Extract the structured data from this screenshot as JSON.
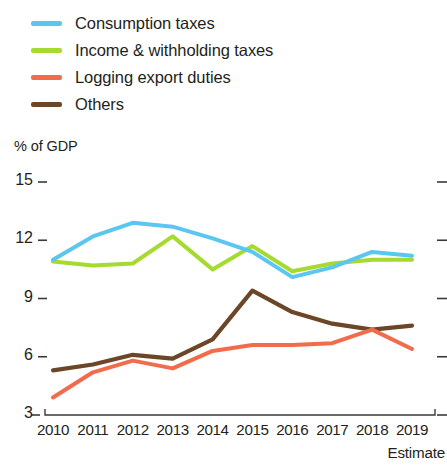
{
  "legend": {
    "items": [
      {
        "label": "Consumption taxes",
        "color": "#5bc6ef",
        "icon": "line-swatch-icon"
      },
      {
        "label": "Income & withholding taxes",
        "color": "#a5da2f",
        "icon": "line-swatch-icon"
      },
      {
        "label": "Logging export duties",
        "color": "#f26b4a",
        "icon": "line-swatch-icon"
      },
      {
        "label": "Others",
        "color": "#6b4627",
        "icon": "line-swatch-icon"
      }
    ]
  },
  "axis": {
    "y_title": "% of GDP",
    "y_ticks": [
      "15",
      "12",
      "9",
      "6",
      "3"
    ],
    "x_ticks": [
      "2010",
      "2011",
      "2012",
      "2013",
      "2014",
      "2015",
      "2016",
      "2017",
      "2018",
      "2019"
    ],
    "note": "Estimate"
  },
  "chart_data": {
    "type": "line",
    "title": "",
    "subtitle": "",
    "xlabel": "",
    "ylabel": "% of GDP",
    "x": [
      "2010",
      "2011",
      "2012",
      "2013",
      "2014",
      "2015",
      "2016",
      "2017",
      "2018",
      "2019"
    ],
    "ylim": [
      3,
      15
    ],
    "yticks": [
      3,
      6,
      9,
      12,
      15
    ],
    "grid": false,
    "legend_position": "top-left",
    "annotations": [
      "Estimate"
    ],
    "series": [
      {
        "name": "Consumption taxes",
        "color": "#5bc6ef",
        "values": [
          11.0,
          12.2,
          12.9,
          12.7,
          12.1,
          11.4,
          10.1,
          10.6,
          11.4,
          11.2
        ]
      },
      {
        "name": "Income & withholding taxes",
        "color": "#a5da2f",
        "values": [
          10.9,
          10.7,
          10.8,
          12.2,
          10.5,
          11.7,
          10.4,
          10.8,
          11.0,
          11.0
        ]
      },
      {
        "name": "Logging export duties",
        "color": "#f26b4a",
        "values": [
          3.9,
          5.2,
          5.8,
          5.4,
          6.3,
          6.6,
          6.6,
          6.7,
          7.4,
          6.4
        ]
      },
      {
        "name": "Others",
        "color": "#6b4627",
        "values": [
          5.3,
          5.6,
          6.1,
          5.9,
          6.9,
          9.4,
          8.3,
          7.7,
          7.4,
          7.6
        ]
      }
    ]
  }
}
